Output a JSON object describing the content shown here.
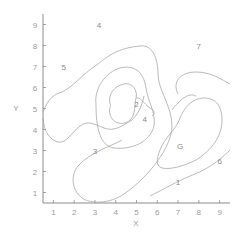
{
  "chart_data": {
    "type": "contour",
    "title": "",
    "xlabel": "X",
    "ylabel": "Y",
    "xlim": [
      0.5,
      9.5
    ],
    "ylim": [
      0.5,
      9.5
    ],
    "xticks": [
      "1",
      "2",
      "3",
      "4",
      "5",
      "6",
      "7",
      "8",
      "9"
    ],
    "yticks": [
      "1",
      "2",
      "3",
      "4",
      "5",
      "6",
      "7",
      "8",
      "9"
    ],
    "grid": false,
    "legend": null,
    "contour_level_labels": [
      {
        "label": "5",
        "x": 1.5,
        "y": 7.0
      },
      {
        "label": "4",
        "x": 3.2,
        "y": 9.0
      },
      {
        "label": "3",
        "x": 3.0,
        "y": 3.0
      },
      {
        "label": "2",
        "x": 5.0,
        "y": 5.2
      },
      {
        "label": "4",
        "x": 5.4,
        "y": 4.5
      },
      {
        "label": "7",
        "x": 8.0,
        "y": 8.0
      },
      {
        "label": "6",
        "x": 9.0,
        "y": 2.5
      },
      {
        "label": "1",
        "x": 7.0,
        "y": 1.5
      },
      {
        "label": "G",
        "x": 7.1,
        "y": 3.2
      }
    ],
    "features": {
      "central_minimum": {
        "x": 4.4,
        "y": 5.0
      },
      "right_closed_region": {
        "x": 7.2,
        "y": 3.3
      }
    }
  }
}
